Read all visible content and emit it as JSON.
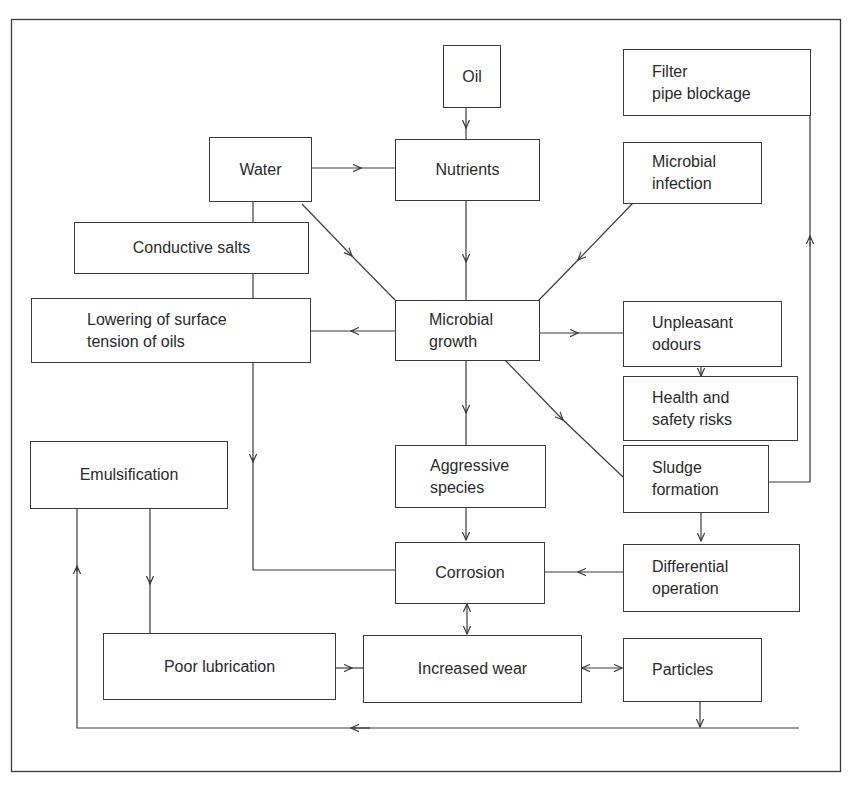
{
  "diagram": {
    "type": "flowchart",
    "nodes": {
      "oil": "Oil",
      "filter": "Filter\npipe blockage",
      "water": "Water",
      "nutrients": "Nutrients",
      "infection": "Microbial\ninfection",
      "salts": "Conductive salts",
      "lowering": "Lowering of surface\ntension of oils",
      "growth": "Microbial\ngrowth",
      "odours": "Unpleasant\nodours",
      "health": "Health and\nsafety risks",
      "emulsification": "Emulsification",
      "aggressive": "Aggressive\nspecies",
      "sludge": "Sludge\nformation",
      "corrosion": "Corrosion",
      "differential": "Differential\noperation",
      "poor_lubrication": "Poor lubrication",
      "wear": "Increased wear",
      "particles": "Particles"
    },
    "edges": [
      {
        "from": "Oil",
        "to": "Nutrients"
      },
      {
        "from": "Water",
        "to": "Nutrients"
      },
      {
        "from": "Water",
        "to": "Microbial growth"
      },
      {
        "from": "Water",
        "to": "Conductive salts",
        "arrow": false
      },
      {
        "from": "Conductive salts",
        "to": "Lowering of surface tension of oils",
        "arrow": false
      },
      {
        "from": "Nutrients",
        "to": "Microbial growth"
      },
      {
        "from": "Microbial infection",
        "to": "Microbial growth"
      },
      {
        "from": "Microbial growth",
        "to": "Lowering of surface tension of oils"
      },
      {
        "from": "Microbial growth",
        "to": "Unpleasant odours"
      },
      {
        "from": "Unpleasant odours",
        "to": "Health and safety risks"
      },
      {
        "from": "Microbial growth",
        "to": "Aggressive species"
      },
      {
        "from": "Microbial growth",
        "to": "Sludge formation"
      },
      {
        "from": "Sludge formation",
        "to": "Filter pipe blockage"
      },
      {
        "from": "Sludge formation",
        "to": "Differential operation"
      },
      {
        "from": "Lowering of surface tension of oils",
        "to": "Corrosion"
      },
      {
        "from": "Aggressive species",
        "to": "Corrosion"
      },
      {
        "from": "Differential operation",
        "to": "Corrosion"
      },
      {
        "from": "Corrosion",
        "to": "Increased wear",
        "bidirectional": true
      },
      {
        "from": "Emulsification",
        "to": "Poor lubrication"
      },
      {
        "from": "Poor lubrication",
        "to": "Increased wear"
      },
      {
        "from": "Increased wear",
        "to": "Particles",
        "bidirectional": true
      },
      {
        "from": "Particles",
        "to": "Emulsification"
      }
    ],
    "colors": {
      "line": "#3a3a3a",
      "background": "#ffffff"
    }
  }
}
